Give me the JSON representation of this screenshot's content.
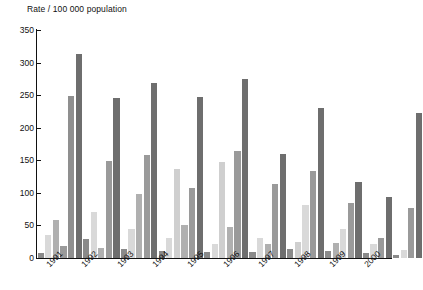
{
  "chart_data": {
    "type": "bar",
    "title": "Rate / 100 000 population",
    "xlabel": "",
    "ylabel": "Rate / 100 000 population",
    "ylim": [
      0,
      350
    ],
    "yticks": [
      0,
      50,
      100,
      150,
      200,
      250,
      300,
      350
    ],
    "grid": false,
    "legend": "none",
    "categories": [
      "1991",
      "1992",
      "1993",
      "1994",
      "1995",
      "1996",
      "1997",
      "1998",
      "1999",
      "2000"
    ],
    "series": [
      {
        "name": "series-1",
        "color": "#8a8a8a",
        "values": [
          8,
          29,
          14,
          11,
          9,
          9,
          14,
          11,
          7,
          5
        ]
      },
      {
        "name": "series-2",
        "color": "#d9d9d9",
        "values": [
          36,
          71,
          98,
          137,
          147,
          30,
          82,
          44,
          21,
          13
        ]
      },
      {
        "name": "series-3",
        "color": "#b0b0b0",
        "values": [
          58,
          149,
          158,
          51,
          48,
          22,
          25,
          23,
          30,
          77
        ]
      },
      {
        "name": "series-4",
        "color": "#6e6e6e",
        "values": [
          249,
          245,
          268,
          108,
          164,
          113,
          133,
          85,
          93,
          222
        ]
      },
      {
        "name": "series-5",
        "color": "#6e6e6e",
        "values": [
          313,
          0,
          248,
          247,
          275,
          160,
          231,
          117,
          0,
          0
        ]
      }
    ],
    "bar_colors": {
      "s1": "#8a8a8a",
      "s2": "#d9d9d9",
      "s3": "#b0b0b0",
      "s4": "#6e6e6e"
    },
    "groups": [
      {
        "year": "1991",
        "bars": [
          {
            "series": "series-1",
            "value": 8,
            "color": "#8a8a8a"
          },
          {
            "series": "series-2",
            "value": 36,
            "color": "#d9d9d9"
          },
          {
            "series": "series-3",
            "value": 58,
            "color": "#b0b0b0"
          },
          {
            "series": "series-4",
            "value": 19,
            "color": "#9a9a9a"
          },
          {
            "series": "series-5",
            "value": 249,
            "color": "#8f8f8f"
          },
          {
            "series": "series-6",
            "value": 313,
            "color": "#6e6e6e"
          }
        ]
      },
      {
        "year": "1992",
        "bars": [
          {
            "series": "series-1",
            "value": 29,
            "color": "#8a8a8a"
          },
          {
            "series": "series-2",
            "value": 71,
            "color": "#d9d9d9"
          },
          {
            "series": "series-3",
            "value": 15,
            "color": "#b0b0b0"
          },
          {
            "series": "series-4",
            "value": 149,
            "color": "#9a9a9a"
          },
          {
            "series": "series-5",
            "value": 245,
            "color": "#6e6e6e"
          }
        ]
      },
      {
        "year": "1993",
        "bars": [
          {
            "series": "series-1",
            "value": 14,
            "color": "#8a8a8a"
          },
          {
            "series": "series-2",
            "value": 45,
            "color": "#d9d9d9"
          },
          {
            "series": "series-3",
            "value": 98,
            "color": "#b0b0b0"
          },
          {
            "series": "series-4",
            "value": 158,
            "color": "#9a9a9a"
          },
          {
            "series": "series-5",
            "value": 268,
            "color": "#6e6e6e"
          }
        ]
      },
      {
        "year": "1994",
        "bars": [
          {
            "series": "series-1",
            "value": 11,
            "color": "#8a8a8a"
          },
          {
            "series": "series-2",
            "value": 30,
            "color": "#d9d9d9"
          },
          {
            "series": "series-3",
            "value": 137,
            "color": "#cfcfcf"
          },
          {
            "series": "series-4",
            "value": 51,
            "color": "#b0b0b0"
          },
          {
            "series": "series-5",
            "value": 108,
            "color": "#9a9a9a"
          },
          {
            "series": "series-6",
            "value": 247,
            "color": "#6e6e6e"
          }
        ]
      },
      {
        "year": "1995",
        "bars": [
          {
            "series": "series-1",
            "value": 9,
            "color": "#8a8a8a"
          },
          {
            "series": "series-2",
            "value": 22,
            "color": "#d9d9d9"
          },
          {
            "series": "series-3",
            "value": 147,
            "color": "#cfcfcf"
          },
          {
            "series": "series-4",
            "value": 48,
            "color": "#b0b0b0"
          },
          {
            "series": "series-5",
            "value": 164,
            "color": "#9a9a9a"
          },
          {
            "series": "series-6",
            "value": 275,
            "color": "#6e6e6e"
          }
        ]
      },
      {
        "year": "1996",
        "bars": [
          {
            "series": "series-1",
            "value": 9,
            "color": "#8a8a8a"
          },
          {
            "series": "series-2",
            "value": 30,
            "color": "#d9d9d9"
          },
          {
            "series": "series-3",
            "value": 22,
            "color": "#b0b0b0"
          },
          {
            "series": "series-4",
            "value": 113,
            "color": "#9a9a9a"
          },
          {
            "series": "series-5",
            "value": 160,
            "color": "#6e6e6e"
          }
        ]
      },
      {
        "year": "1997",
        "bars": [
          {
            "series": "series-1",
            "value": 14,
            "color": "#8a8a8a"
          },
          {
            "series": "series-2",
            "value": 25,
            "color": "#cfcfcf"
          },
          {
            "series": "series-3",
            "value": 82,
            "color": "#d9d9d9"
          },
          {
            "series": "series-4",
            "value": 133,
            "color": "#9a9a9a"
          },
          {
            "series": "series-5",
            "value": 231,
            "color": "#6e6e6e"
          }
        ]
      },
      {
        "year": "1998",
        "bars": [
          {
            "series": "series-1",
            "value": 11,
            "color": "#8a8a8a"
          },
          {
            "series": "series-2",
            "value": 23,
            "color": "#b0b0b0"
          },
          {
            "series": "series-3",
            "value": 44,
            "color": "#d9d9d9"
          },
          {
            "series": "series-4",
            "value": 85,
            "color": "#9a9a9a"
          },
          {
            "series": "series-5",
            "value": 117,
            "color": "#6e6e6e"
          }
        ]
      },
      {
        "year": "1999",
        "bars": [
          {
            "series": "series-1",
            "value": 7,
            "color": "#8a8a8a"
          },
          {
            "series": "series-2",
            "value": 21,
            "color": "#d9d9d9"
          },
          {
            "series": "series-3",
            "value": 30,
            "color": "#9a9a9a"
          },
          {
            "series": "series-4",
            "value": 93,
            "color": "#6e6e6e"
          }
        ]
      },
      {
        "year": "2000",
        "bars": [
          {
            "series": "series-1",
            "value": 5,
            "color": "#8a8a8a"
          },
          {
            "series": "series-2",
            "value": 13,
            "color": "#d9d9d9"
          },
          {
            "series": "series-3",
            "value": 77,
            "color": "#9a9a9a"
          },
          {
            "series": "series-4",
            "value": 222,
            "color": "#6e6e6e"
          }
        ]
      }
    ]
  }
}
